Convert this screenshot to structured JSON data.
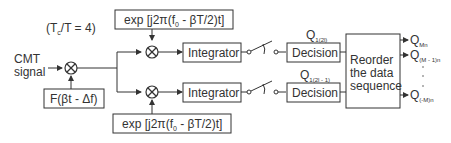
{
  "diagram": {
    "ratio_label": "(T",
    "ratio_sub": "c",
    "ratio_rest": "/T = 4)",
    "input": {
      "line1": "CMT",
      "line2": "signal"
    },
    "chirp_box": "F(βt - Δf)",
    "exp_top": {
      "pre": "exp [j2π(f",
      "sub": "0",
      "post": " - βT/2)t]"
    },
    "exp_bottom": {
      "pre": "exp [j2π(f",
      "sub": "0",
      "post": " - βT/2)t]"
    },
    "integrator_top": "Integrator",
    "integrator_bottom": "Integrator",
    "decision_top": "Decision",
    "decision_bottom": "Decision",
    "q_top": {
      "main": "Q",
      "sub": "1(2l)"
    },
    "q_bottom": {
      "main": "Q",
      "sub": "1(2l - 1)"
    },
    "reorder": {
      "line1": "Reorder",
      "line2": "the data",
      "line3": "sequence"
    },
    "outputs": [
      {
        "main": "Q",
        "sub": "Mn"
      },
      {
        "main": "Q",
        "sub": "(M - 1)n"
      },
      {
        "main": "Q",
        "sub": "(-M)n"
      }
    ]
  }
}
